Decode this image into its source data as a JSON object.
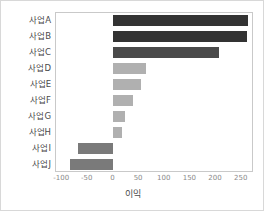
{
  "chart_data": {
    "type": "bar",
    "orientation": "horizontal",
    "title": "",
    "xlabel": "이익",
    "ylabel": "",
    "categories": [
      "사업A",
      "사업B",
      "사업C",
      "사업D",
      "사업E",
      "사업F",
      "사업G",
      "사업H",
      "사업I",
      "사업J"
    ],
    "values": [
      262,
      260,
      206,
      64,
      54,
      38,
      22,
      16,
      -70,
      -84
    ],
    "bar_colors": [
      "#333333",
      "#333333",
      "#4a4a4a",
      "#b0b0b0",
      "#b0b0b0",
      "#b0b0b0",
      "#b0b0b0",
      "#b0b0b0",
      "#7a7a7a",
      "#7a7a7a"
    ],
    "xlim": [
      -112,
      274
    ],
    "xticks": [
      -100,
      -50,
      0,
      50,
      100,
      150,
      200,
      250
    ],
    "xtick_labels": [
      "-100",
      "-50",
      "0",
      "50",
      "100",
      "150",
      "200",
      "250"
    ],
    "grid": false,
    "legend": null
  },
  "axis": {
    "x_label_text": "이익"
  }
}
